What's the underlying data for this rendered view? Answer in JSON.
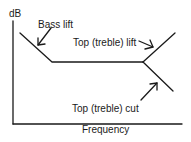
{
  "diagram": {
    "y_axis_label": "dB",
    "x_axis_label": "Frequency",
    "annotations": {
      "bass_lift": "Bass lift",
      "treble_lift": "Top (treble) lift",
      "treble_cut": "Top (treble) cut"
    },
    "colors": {
      "line": "#1a1a1a",
      "background": "#ffffff"
    }
  }
}
